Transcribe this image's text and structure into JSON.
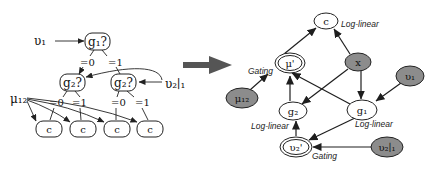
{
  "left_tree": {
    "input_labels": {
      "v1": "υ₁",
      "v21": "υ₂∣₁",
      "mu12": "μ₁₂"
    },
    "root": {
      "label": "g₁?"
    },
    "root_branches": [
      "=0",
      "=1"
    ],
    "level2": [
      {
        "label": "g₂?",
        "branches": [
          "=0",
          "=1"
        ]
      },
      {
        "label": "g₂?",
        "branches": [
          "=0",
          "=1"
        ]
      }
    ],
    "leaves": [
      "c",
      "c",
      "c",
      "c"
    ]
  },
  "transform_arrow": {
    "icon": "right-arrow-icon",
    "color": "#555555"
  },
  "right_graph": {
    "nodes": {
      "c": {
        "label": "c",
        "annotation": "Log-linear",
        "style": "open"
      },
      "mu_prime": {
        "label": "μ'",
        "annotation": "Gating",
        "style": "double"
      },
      "x": {
        "label": "x",
        "style": "filled"
      },
      "v1": {
        "label": "υ₁",
        "style": "filled"
      },
      "mu12": {
        "label": "μ₁₂",
        "style": "filled"
      },
      "g2": {
        "label": "g₂",
        "annotation": "Log-linear",
        "style": "open"
      },
      "g1": {
        "label": "g₁",
        "annotation": "Log-linear",
        "style": "open"
      },
      "v2_prime": {
        "label": "υ₂'",
        "annotation": "Gating",
        "style": "double"
      },
      "v21": {
        "label": "υ₂∣₁",
        "style": "filled"
      }
    },
    "edges": [
      [
        "mu_prime",
        "c"
      ],
      [
        "x",
        "c"
      ],
      [
        "x",
        "g2"
      ],
      [
        "x",
        "g1"
      ],
      [
        "v1",
        "g1"
      ],
      [
        "mu12",
        "mu_prime"
      ],
      [
        "g2",
        "mu_prime"
      ],
      [
        "g1",
        "mu_prime"
      ],
      [
        "g1",
        "v2_prime"
      ],
      [
        "v2_prime",
        "g2"
      ],
      [
        "v21",
        "v2_prime"
      ]
    ],
    "colors": {
      "filled_node": "#8c8c8c",
      "stroke": "#222222"
    }
  }
}
